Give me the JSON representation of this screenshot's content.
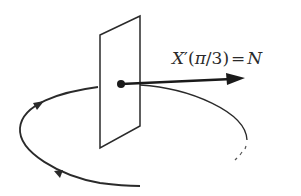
{
  "diagram": {
    "label": {
      "lhs_var": "X",
      "prime": "′",
      "open_paren": "(",
      "pi": "π",
      "slash": "/",
      "three": "3",
      "close_paren": ")",
      "equals": "=",
      "rhs": "N",
      "full_text": "X′(π/3) = N"
    },
    "elements": {
      "plane": "normal-plane",
      "point": "curve-point",
      "vector": "tangent-vector",
      "curve": "closed-oriented-curve",
      "orientation_arrows": 2
    },
    "colors": {
      "stroke": "#2a2a2a",
      "background": "#ffffff"
    }
  }
}
